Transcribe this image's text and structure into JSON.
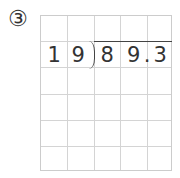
{
  "problem_number": "③",
  "divisor": [
    "1",
    "9"
  ],
  "dividend": [
    "8",
    "9",
    ".",
    "3"
  ],
  "grid": {
    "columns": 5,
    "rows": 6
  }
}
